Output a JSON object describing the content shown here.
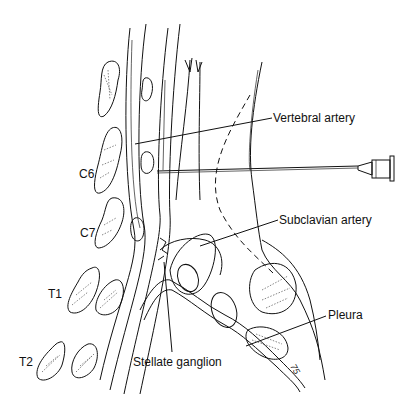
{
  "figure": {
    "labels": {
      "vertebral_artery": "Vertebral artery",
      "subclavian_artery": "Subclavian artery",
      "pleura": "Pleura",
      "stellate_ganglion": "Stellate ganglion",
      "c6": "C6",
      "c7": "C7",
      "t1": "T1",
      "t2": "T2"
    },
    "signature": "75"
  }
}
